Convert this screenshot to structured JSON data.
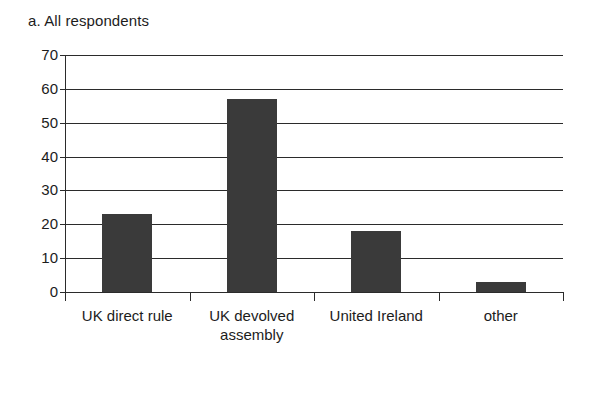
{
  "chart_data": {
    "type": "bar",
    "title": "a. All respondents",
    "xlabel": "",
    "ylabel": "",
    "categories": [
      "UK direct rule",
      "UK devolved assembly",
      "United Ireland",
      "other"
    ],
    "values": [
      23,
      57,
      18,
      3
    ],
    "series": [
      {
        "name": "All respondents",
        "values": [
          23,
          57,
          18,
          3
        ]
      }
    ],
    "ylim": [
      0,
      70
    ],
    "ytick_step": 10,
    "yticks": [
      0,
      10,
      20,
      30,
      40,
      50,
      60,
      70
    ],
    "ytick_labels": [
      "0",
      "10",
      "20",
      "30",
      "40",
      "50",
      "60",
      "70"
    ],
    "grid": true,
    "grid_axis": "y",
    "legend": false,
    "legend_position": "none",
    "bar_color": "#3a3a3a",
    "axis_color": "#2b2b2b",
    "background_color": "#ffffff"
  }
}
